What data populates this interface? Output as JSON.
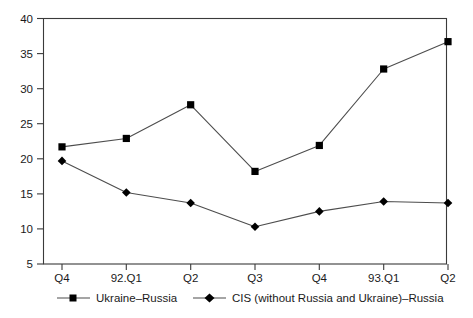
{
  "chart_data": {
    "type": "line",
    "title": "",
    "subtitle": "",
    "xlabel": "",
    "ylabel": "",
    "categories": [
      "Q4",
      "92.Q1",
      "Q2",
      "Q3",
      "Q4",
      "93.Q1",
      "Q2"
    ],
    "ylim": [
      5,
      40
    ],
    "yticks": [
      5,
      10,
      15,
      20,
      25,
      30,
      35,
      40
    ],
    "ytick_labels": [
      "5",
      "10",
      "15",
      "20",
      "25",
      "30",
      "35",
      "40"
    ],
    "grid": false,
    "legend_position": "bottom",
    "series": [
      {
        "name": "Ukraine–Russia",
        "marker": "square",
        "color": "#000000",
        "values": [
          21.7,
          22.9,
          27.7,
          18.2,
          21.9,
          32.8,
          36.7
        ]
      },
      {
        "name": "CIS (without Russia and Ukraine)–Russia",
        "marker": "diamond",
        "color": "#000000",
        "values": [
          19.7,
          15.2,
          13.7,
          10.3,
          12.5,
          13.9,
          13.7
        ]
      }
    ]
  },
  "axes": {
    "y_tick_labels": [
      "40",
      "35",
      "30",
      "25",
      "20",
      "15",
      "10",
      "5"
    ],
    "x_tick_labels": [
      "Q4",
      "92.Q1",
      "Q2",
      "Q3",
      "Q4",
      "93.Q1",
      "Q2"
    ]
  },
  "legend": {
    "entries": [
      {
        "label": "Ukraine–Russia",
        "marker": "square-marker-icon"
      },
      {
        "label": "CIS (without Russia and Ukraine)–Russia",
        "marker": "diamond-marker-icon"
      }
    ]
  },
  "colors": {
    "line": "#4d4d4d",
    "marker": "#000000",
    "frame": "#3a3a3a",
    "background": "#ffffff"
  }
}
